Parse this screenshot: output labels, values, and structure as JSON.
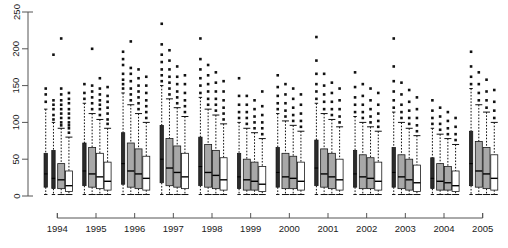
{
  "chart_data": {
    "type": "boxplot",
    "title": "",
    "xlabel": "",
    "ylabel": "",
    "ylim": [
      0,
      250
    ],
    "y_ticks": [
      0,
      50,
      100,
      150,
      200,
      250
    ],
    "grid": false,
    "legend": "none",
    "categories": [
      "1994",
      "1995",
      "1996",
      "1997",
      "1998",
      "1999",
      "2000",
      "2001",
      "2002",
      "2003",
      "2004",
      "2005"
    ],
    "boxes_per_category": 4,
    "series": [
      {
        "name": "1994",
        "boxes": [
          {
            "style": "dark",
            "lower_whisker": 2,
            "q1": 12,
            "median": 30,
            "q3": 58,
            "upper_whisker": 118,
            "outliers": [
              128,
              138,
              146
            ]
          },
          {
            "style": "dark",
            "lower_whisker": 2,
            "q1": 10,
            "median": 24,
            "q3": 62,
            "upper_whisker": 100,
            "outliers": [
              104,
              110,
              118,
              124,
              130,
              192
            ]
          },
          {
            "style": "gray",
            "lower_whisker": 2,
            "q1": 10,
            "median": 22,
            "q3": 44,
            "upper_whisker": 92,
            "outliers": [
              96,
              100,
              106,
              112,
              118,
              124,
              130,
              138,
              146,
              214
            ]
          },
          {
            "style": "white",
            "lower_whisker": 2,
            "q1": 6,
            "median": 14,
            "q3": 34,
            "upper_whisker": 80,
            "outliers": [
              86,
              92,
              96,
              100,
              106,
              112,
              118,
              126,
              132,
              140
            ]
          }
        ]
      },
      {
        "name": "1995",
        "boxes": [
          {
            "style": "dark",
            "lower_whisker": 2,
            "q1": 14,
            "median": 34,
            "q3": 72,
            "upper_whisker": 126,
            "outliers": [
              132,
              140,
              152
            ]
          },
          {
            "style": "gray",
            "lower_whisker": 2,
            "q1": 12,
            "median": 30,
            "q3": 66,
            "upper_whisker": 112,
            "outliers": [
              118,
              126,
              134,
              142,
              150,
              200
            ]
          },
          {
            "style": "white",
            "lower_whisker": 2,
            "q1": 10,
            "median": 26,
            "q3": 58,
            "upper_whisker": 104,
            "outliers": [
              110,
              118,
              124,
              130,
              138,
              146,
              160
            ]
          },
          {
            "style": "white",
            "lower_whisker": 2,
            "q1": 8,
            "median": 20,
            "q3": 46,
            "upper_whisker": 92,
            "outliers": [
              98,
              104,
              112,
              120,
              128,
              136,
              148
            ]
          }
        ]
      },
      {
        "name": "1996",
        "boxes": [
          {
            "style": "dark",
            "lower_whisker": 2,
            "q1": 16,
            "median": 44,
            "q3": 86,
            "upper_whisker": 140,
            "outliers": [
              146,
              152,
              158,
              166,
              178,
              186,
              196,
              258
            ]
          },
          {
            "style": "gray",
            "lower_whisker": 2,
            "q1": 12,
            "median": 34,
            "q3": 72,
            "upper_whisker": 124,
            "outliers": [
              130,
              138,
              146,
              156,
              166,
              174,
              210
            ]
          },
          {
            "style": "gray",
            "lower_whisker": 2,
            "q1": 10,
            "median": 30,
            "q3": 64,
            "upper_whisker": 112,
            "outliers": [
              118,
              126,
              134,
              142,
              150,
              160,
              172
            ]
          },
          {
            "style": "white",
            "lower_whisker": 2,
            "q1": 8,
            "median": 24,
            "q3": 54,
            "upper_whisker": 100,
            "outliers": [
              106,
              114,
              122,
              130,
              140,
              150,
              162
            ]
          }
        ]
      },
      {
        "name": "1997",
        "boxes": [
          {
            "style": "dark",
            "lower_whisker": 2,
            "q1": 18,
            "median": 50,
            "q3": 96,
            "upper_whisker": 150,
            "outliers": [
              156,
              164,
              172,
              182,
              192,
              206,
              234
            ]
          },
          {
            "style": "gray",
            "lower_whisker": 2,
            "q1": 14,
            "median": 38,
            "q3": 78,
            "upper_whisker": 132,
            "outliers": [
              138,
              146,
              154,
              162,
              172,
              184,
              198
            ]
          },
          {
            "style": "gray",
            "lower_whisker": 2,
            "q1": 12,
            "median": 32,
            "q3": 68,
            "upper_whisker": 120,
            "outliers": [
              126,
              134,
              142,
              152,
              162,
              176
            ]
          },
          {
            "style": "white",
            "lower_whisker": 2,
            "q1": 10,
            "median": 26,
            "q3": 58,
            "upper_whisker": 108,
            "outliers": [
              114,
              122,
              130,
              140,
              152,
              164
            ]
          }
        ]
      },
      {
        "name": "1998",
        "boxes": [
          {
            "style": "dark",
            "lower_whisker": 2,
            "q1": 14,
            "median": 40,
            "q3": 80,
            "upper_whisker": 134,
            "outliers": [
              140,
              150,
              160,
              172,
              186,
              214
            ]
          },
          {
            "style": "gray",
            "lower_whisker": 2,
            "q1": 12,
            "median": 32,
            "q3": 70,
            "upper_whisker": 118,
            "outliers": [
              124,
              132,
              142,
              152,
              164,
              178
            ]
          },
          {
            "style": "gray",
            "lower_whisker": 2,
            "q1": 10,
            "median": 28,
            "q3": 62,
            "upper_whisker": 110,
            "outliers": [
              116,
              124,
              132,
              142,
              154,
              168
            ]
          },
          {
            "style": "white",
            "lower_whisker": 2,
            "q1": 8,
            "median": 22,
            "q3": 52,
            "upper_whisker": 98,
            "outliers": [
              104,
              112,
              120,
              130,
              142,
              156
            ]
          }
        ]
      },
      {
        "name": "1999",
        "boxes": [
          {
            "style": "dark",
            "lower_whisker": 2,
            "q1": 10,
            "median": 26,
            "q3": 58,
            "upper_whisker": 100,
            "outliers": [
              106,
              114,
              124,
              136,
              160
            ]
          },
          {
            "style": "gray",
            "lower_whisker": 2,
            "q1": 8,
            "median": 22,
            "q3": 50,
            "upper_whisker": 92,
            "outliers": [
              98,
              106,
              114,
              124,
              136
            ]
          },
          {
            "style": "gray",
            "lower_whisker": 2,
            "q1": 8,
            "median": 20,
            "q3": 46,
            "upper_whisker": 86,
            "outliers": [
              92,
              100,
              108,
              118,
              130
            ]
          },
          {
            "style": "white",
            "lower_whisker": 2,
            "q1": 6,
            "median": 16,
            "q3": 40,
            "upper_whisker": 78,
            "outliers": [
              84,
              92,
              100,
              110,
              122,
              142
            ]
          }
        ]
      },
      {
        "name": "2000",
        "boxes": [
          {
            "style": "dark",
            "lower_whisker": 2,
            "q1": 12,
            "median": 32,
            "q3": 66,
            "upper_whisker": 112,
            "outliers": [
              118,
              126,
              136,
              148,
              164
            ]
          },
          {
            "style": "gray",
            "lower_whisker": 2,
            "q1": 10,
            "median": 26,
            "q3": 58,
            "upper_whisker": 102,
            "outliers": [
              108,
              116,
              126,
              138,
              152
            ]
          },
          {
            "style": "gray",
            "lower_whisker": 2,
            "q1": 10,
            "median": 24,
            "q3": 54,
            "upper_whisker": 96,
            "outliers": [
              102,
              110,
              120,
              132,
              146
            ]
          },
          {
            "style": "white",
            "lower_whisker": 2,
            "q1": 8,
            "median": 20,
            "q3": 46,
            "upper_whisker": 88,
            "outliers": [
              94,
              102,
              112,
              124,
              138
            ]
          }
        ]
      },
      {
        "name": "2001",
        "boxes": [
          {
            "style": "dark",
            "lower_whisker": 2,
            "q1": 14,
            "median": 38,
            "q3": 76,
            "upper_whisker": 126,
            "outliers": [
              132,
              142,
              152,
              166,
              184,
              216
            ]
          },
          {
            "style": "gray",
            "lower_whisker": 2,
            "q1": 12,
            "median": 30,
            "q3": 64,
            "upper_whisker": 112,
            "outliers": [
              118,
              128,
              138,
              150,
              166
            ]
          },
          {
            "style": "gray",
            "lower_whisker": 2,
            "q1": 10,
            "median": 26,
            "q3": 58,
            "upper_whisker": 104,
            "outliers": [
              110,
              118,
              128,
              140,
              154
            ]
          },
          {
            "style": "white",
            "lower_whisker": 2,
            "q1": 8,
            "median": 22,
            "q3": 50,
            "upper_whisker": 94,
            "outliers": [
              100,
              108,
              118,
              130,
              146
            ]
          }
        ]
      },
      {
        "name": "2002",
        "boxes": [
          {
            "style": "dark",
            "lower_whisker": 2,
            "q1": 12,
            "median": 30,
            "q3": 62,
            "upper_whisker": 108,
            "outliers": [
              114,
              124,
              134,
              148,
              168
            ]
          },
          {
            "style": "gray",
            "lower_whisker": 2,
            "q1": 10,
            "median": 26,
            "q3": 56,
            "upper_whisker": 100,
            "outliers": [
              106,
              114,
              124,
              136,
              152
            ]
          },
          {
            "style": "gray",
            "lower_whisker": 2,
            "q1": 10,
            "median": 24,
            "q3": 52,
            "upper_whisker": 94,
            "outliers": [
              100,
              108,
              118,
              130,
              146
            ]
          },
          {
            "style": "white",
            "lower_whisker": 2,
            "q1": 8,
            "median": 20,
            "q3": 46,
            "upper_whisker": 88,
            "outliers": [
              94,
              102,
              112,
              124,
              140
            ]
          }
        ]
      },
      {
        "name": "2003",
        "boxes": [
          {
            "style": "dark",
            "lower_whisker": 2,
            "q1": 12,
            "median": 32,
            "q3": 66,
            "upper_whisker": 114,
            "outliers": [
              120,
              130,
              142,
              156,
              176,
              214
            ]
          },
          {
            "style": "gray",
            "lower_whisker": 2,
            "q1": 10,
            "median": 26,
            "q3": 56,
            "upper_whisker": 100,
            "outliers": [
              106,
              114,
              124,
              138,
              154
            ]
          },
          {
            "style": "gray",
            "lower_whisker": 2,
            "q1": 8,
            "median": 22,
            "q3": 50,
            "upper_whisker": 92,
            "outliers": [
              98,
              106,
              116,
              128,
              144
            ]
          },
          {
            "style": "white",
            "lower_whisker": 2,
            "q1": 6,
            "median": 18,
            "q3": 42,
            "upper_whisker": 82,
            "outliers": [
              88,
              96,
              106,
              118,
              134
            ]
          }
        ]
      },
      {
        "name": "2004",
        "boxes": [
          {
            "style": "dark",
            "lower_whisker": 2,
            "q1": 10,
            "median": 24,
            "q3": 52,
            "upper_whisker": 92,
            "outliers": [
              98,
              106,
              116,
              130
            ]
          },
          {
            "style": "gray",
            "lower_whisker": 2,
            "q1": 8,
            "median": 20,
            "q3": 44,
            "upper_whisker": 84,
            "outliers": [
              90,
              98,
              108,
              120
            ]
          },
          {
            "style": "gray",
            "lower_whisker": 2,
            "q1": 8,
            "median": 18,
            "q3": 40,
            "upper_whisker": 78,
            "outliers": [
              84,
              92,
              102,
              114
            ]
          },
          {
            "style": "white",
            "lower_whisker": 2,
            "q1": 6,
            "median": 14,
            "q3": 34,
            "upper_whisker": 70,
            "outliers": [
              76,
              84,
              94,
              106
            ]
          }
        ]
      },
      {
        "name": "2005",
        "boxes": [
          {
            "style": "dark",
            "lower_whisker": 2,
            "q1": 14,
            "median": 44,
            "q3": 88,
            "upper_whisker": 146,
            "outliers": [
              152,
              162,
              176,
              196
            ]
          },
          {
            "style": "gray",
            "lower_whisker": 2,
            "q1": 12,
            "median": 34,
            "q3": 74,
            "upper_whisker": 124,
            "outliers": [
              130,
              140,
              152,
              168
            ]
          },
          {
            "style": "gray",
            "lower_whisker": 2,
            "q1": 10,
            "median": 30,
            "q3": 66,
            "upper_whisker": 114,
            "outliers": [
              120,
              130,
              142,
              158
            ]
          },
          {
            "style": "white",
            "lower_whisker": 2,
            "q1": 8,
            "median": 24,
            "q3": 56,
            "upper_whisker": 100,
            "outliers": [
              106,
              116,
              128,
              144
            ]
          }
        ]
      }
    ]
  }
}
